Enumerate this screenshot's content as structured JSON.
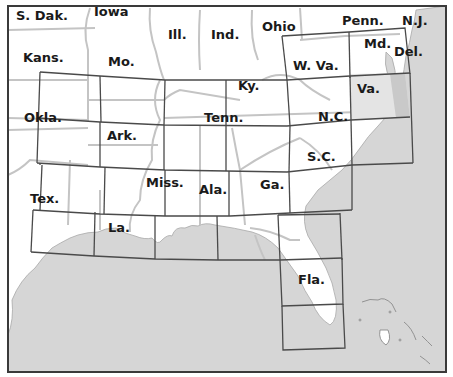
{
  "map": {
    "type": "index-map",
    "region": "Southeastern United States",
    "colors": {
      "land": "#ffffff",
      "water": "#d6d6d6",
      "state_border": "#c4c4c4",
      "sheet_border": "#4a4a4a",
      "frame": "#3a3a3a",
      "highlight_sheet": "#dcdcdc",
      "label": "#1a1a1a"
    },
    "state_labels": [
      {
        "name": "S. Dak.",
        "x": 16,
        "y": 20
      },
      {
        "name": "Iowa",
        "x": 94,
        "y": 16
      },
      {
        "name": "Ill.",
        "x": 168,
        "y": 39
      },
      {
        "name": "Ind.",
        "x": 211,
        "y": 39
      },
      {
        "name": "Ohio",
        "x": 262,
        "y": 31
      },
      {
        "name": "Penn.",
        "x": 342,
        "y": 25
      },
      {
        "name": "N.J.",
        "x": 402,
        "y": 25
      },
      {
        "name": "Md.",
        "x": 364,
        "y": 48
      },
      {
        "name": "Del.",
        "x": 394,
        "y": 56
      },
      {
        "name": "Kans.",
        "x": 23,
        "y": 62
      },
      {
        "name": "Mo.",
        "x": 108,
        "y": 66
      },
      {
        "name": "W. Va.",
        "x": 293,
        "y": 70
      },
      {
        "name": "Ky.",
        "x": 238,
        "y": 90
      },
      {
        "name": "Va.",
        "x": 357,
        "y": 93
      },
      {
        "name": "Okla.",
        "x": 24,
        "y": 122
      },
      {
        "name": "Tenn.",
        "x": 204,
        "y": 122
      },
      {
        "name": "N.C.",
        "x": 318,
        "y": 121
      },
      {
        "name": "Ark.",
        "x": 107,
        "y": 140
      },
      {
        "name": "S.C.",
        "x": 307,
        "y": 161
      },
      {
        "name": "Miss.",
        "x": 146,
        "y": 187
      },
      {
        "name": "Ala.",
        "x": 199,
        "y": 194
      },
      {
        "name": "Ga.",
        "x": 260,
        "y": 189
      },
      {
        "name": "Tex.",
        "x": 30,
        "y": 203
      },
      {
        "name": "La.",
        "x": 108,
        "y": 232
      },
      {
        "name": "Fla.",
        "x": 298,
        "y": 284
      }
    ],
    "highlighted_sheet": "Va."
  }
}
